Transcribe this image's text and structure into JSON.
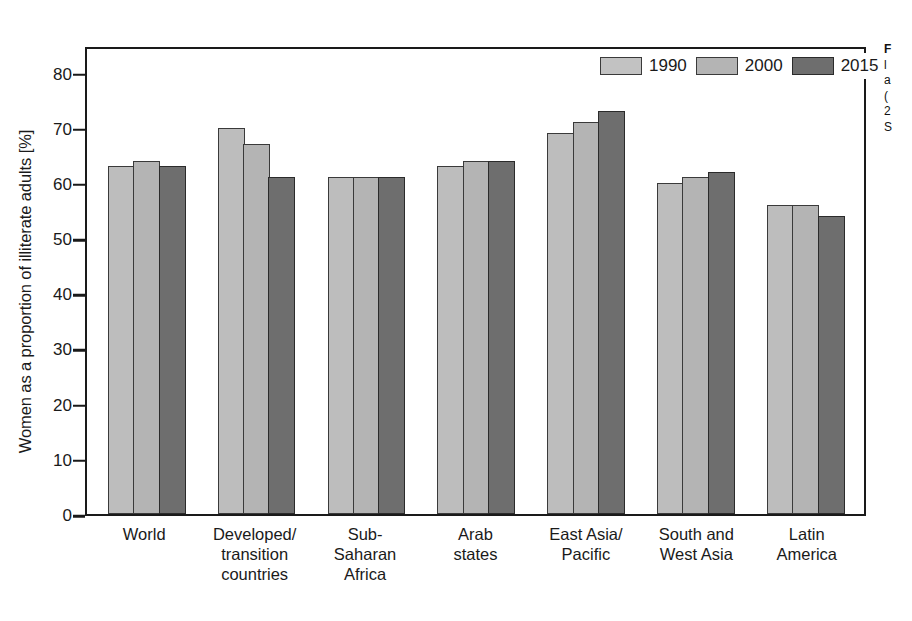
{
  "chart_data": {
    "type": "bar",
    "title": "",
    "xlabel": "",
    "ylabel": "Women as a proportion of illiterate adults [%]",
    "ylim": [
      0,
      85
    ],
    "yticks": [
      0,
      10,
      20,
      30,
      40,
      50,
      60,
      70,
      80
    ],
    "grid": false,
    "legend_position": "top-right",
    "categories": [
      "World",
      "Developed/\ntransition\ncountries",
      "Sub-\nSaharan\nAfrica",
      "Arab\nstates",
      "East Asia/\nPacific",
      "South and\nWest Asia",
      "Latin\nAmerica"
    ],
    "category_lines": [
      [
        "World"
      ],
      [
        "Developed/",
        "transition",
        "countries"
      ],
      [
        "Sub-",
        "Saharan",
        "Africa"
      ],
      [
        "Arab",
        "states"
      ],
      [
        "East Asia/",
        "Pacific"
      ],
      [
        "South and",
        "West Asia"
      ],
      [
        "Latin",
        "America"
      ]
    ],
    "series": [
      {
        "name": "1990",
        "color": "#bdbdbd",
        "values": [
          63,
          70,
          61,
          63,
          69,
          60,
          56
        ]
      },
      {
        "name": "2000",
        "color": "#b4b4b4",
        "values": [
          64,
          67,
          61,
          64,
          71,
          61,
          56
        ]
      },
      {
        "name": "2015",
        "color": "#6e6e6e",
        "values": [
          63,
          61,
          61,
          64,
          73,
          62,
          54
        ]
      }
    ]
  },
  "legend": {
    "items": [
      {
        "label": "1990"
      },
      {
        "label": "2000"
      },
      {
        "label": "2015"
      }
    ]
  },
  "caption": {
    "lines": [
      "F",
      "l",
      "a",
      "(",
      "2",
      "S"
    ]
  }
}
